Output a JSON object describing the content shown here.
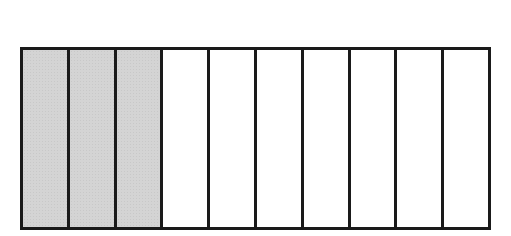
{
  "diagram": {
    "type": "fraction-bar",
    "total_parts": 10,
    "shaded_parts": 3,
    "shaded_color": "#d4d4d4",
    "unshaded_color": "#ffffff",
    "border_color": "#1a1a1a",
    "segments": [
      {
        "index": 1,
        "shaded": true
      },
      {
        "index": 2,
        "shaded": true
      },
      {
        "index": 3,
        "shaded": true
      },
      {
        "index": 4,
        "shaded": false
      },
      {
        "index": 5,
        "shaded": false
      },
      {
        "index": 6,
        "shaded": false
      },
      {
        "index": 7,
        "shaded": false
      },
      {
        "index": 8,
        "shaded": false
      },
      {
        "index": 9,
        "shaded": false
      },
      {
        "index": 10,
        "shaded": false
      }
    ]
  }
}
